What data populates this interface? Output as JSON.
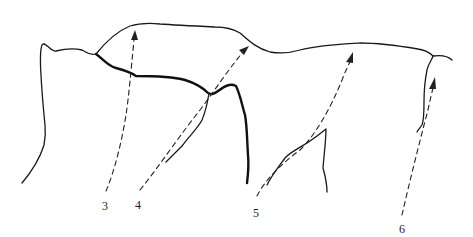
{
  "figure": {
    "type": "line-drawing",
    "colors": {
      "background": "#ffffff",
      "ink": "#1a1a1a"
    },
    "arrows": [
      {
        "id": "3",
        "label": "3"
      },
      {
        "id": "4",
        "label": "4"
      },
      {
        "id": "5",
        "label": "5"
      },
      {
        "id": "6",
        "label": "6"
      }
    ]
  }
}
